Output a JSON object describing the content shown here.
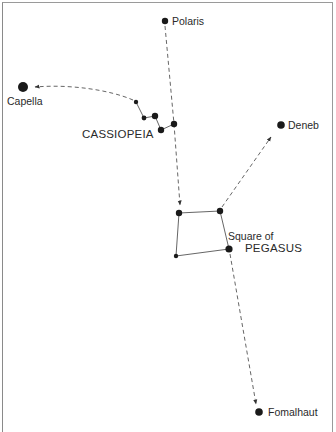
{
  "diagram": {
    "type": "star-chart",
    "stars": [
      {
        "name": "Polaris",
        "x": 165,
        "y": 21,
        "r": 3.2
      },
      {
        "name": "Capella",
        "x": 23,
        "y": 87,
        "r": 5
      },
      {
        "name": "Deneb",
        "x": 281,
        "y": 125,
        "r": 3.8
      },
      {
        "name": "Fomalhaut",
        "x": 259,
        "y": 412,
        "r": 3.8
      }
    ],
    "constellations": [
      {
        "name": "Cassiopeia",
        "stars": [
          [
            136,
            102
          ],
          [
            144,
            118
          ],
          [
            155,
            116
          ],
          [
            161,
            130
          ],
          [
            174,
            124
          ]
        ],
        "radii": [
          2.2,
          2.4,
          3.2,
          3.2,
          3.2
        ]
      },
      {
        "name": "Square of Pegasus",
        "stars": [
          [
            179,
            213
          ],
          [
            220,
            211
          ],
          [
            229,
            249
          ],
          [
            176,
            256
          ]
        ],
        "radii": [
          3.2,
          3.2,
          3.6,
          2.2
        ]
      }
    ],
    "labels": {
      "polaris": "Polaris",
      "capella": "Capella",
      "deneb": "Deneb",
      "fomalhaut": "Fomalhaut",
      "cassiopeia": "CASSIOPEIA",
      "pegasus_line1": "Square of",
      "pegasus_line2": "PEGASUS"
    },
    "pointers": [
      {
        "from": "Polaris",
        "to": "Square of Pegasus",
        "style": "dashed"
      },
      {
        "from": "Cassiopeia",
        "to": "Capella",
        "style": "dashed-curve"
      },
      {
        "from": "Square of Pegasus",
        "to": "Deneb",
        "style": "dashed"
      },
      {
        "from": "Square of Pegasus",
        "to": "Fomalhaut",
        "style": "dashed"
      }
    ],
    "colors": {
      "star": "#1a1a1a",
      "line": "#555555",
      "text": "#2a2a2a"
    }
  }
}
